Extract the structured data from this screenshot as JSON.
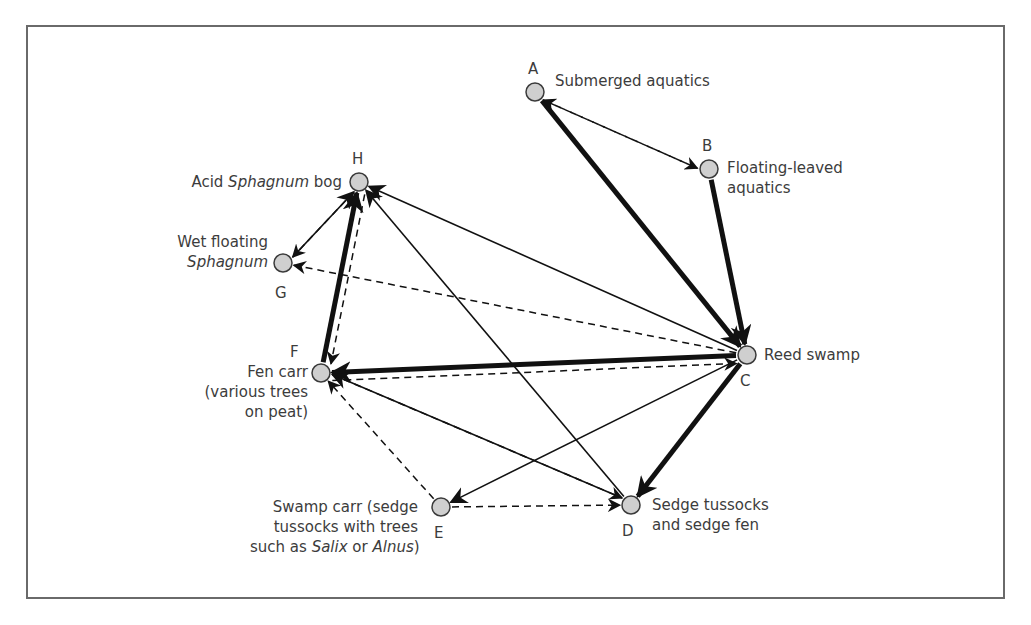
{
  "figure": {
    "colors": {
      "node_fill": "#cfcfcf",
      "node_stroke": "#3a3a3a",
      "edge": "#111111",
      "frame": "#6a6a6a",
      "text": "#3c3c3c"
    }
  },
  "nodes": [
    {
      "id": "A",
      "x": 535,
      "y": 92,
      "letter": "A",
      "label_lines": [
        "Submerged aquatics"
      ]
    },
    {
      "id": "B",
      "x": 709,
      "y": 169,
      "letter": "B",
      "label_lines": [
        "Floating-leaved",
        "aquatics"
      ]
    },
    {
      "id": "C",
      "x": 747,
      "y": 355,
      "letter": "C",
      "label_lines": [
        "Reed swamp"
      ]
    },
    {
      "id": "D",
      "x": 631,
      "y": 505,
      "letter": "D",
      "label_lines": [
        "Sedge tussocks",
        "and sedge fen"
      ]
    },
    {
      "id": "E",
      "x": 441,
      "y": 507,
      "letter": "E",
      "label_lines": [
        "Swamp carr (sedge",
        "tussocks with trees",
        "such as ",
        "Salix",
        " or ",
        "Alnus",
        ")"
      ]
    },
    {
      "id": "F",
      "x": 321,
      "y": 373,
      "letter": "F",
      "label_lines": [
        "Fen carr",
        "(various trees",
        "on peat)"
      ]
    },
    {
      "id": "G",
      "x": 283,
      "y": 263,
      "letter": "G",
      "label_lines": [
        "Wet floating",
        "Sphagnum"
      ]
    },
    {
      "id": "H",
      "x": 359,
      "y": 182,
      "letter": "H",
      "label_lines": [
        "Acid ",
        "Sphagnum",
        " bog"
      ]
    }
  ],
  "labels": {
    "A": "Submerged aquatics",
    "B1": "Floating-leaved",
    "B2": "aquatics",
    "C": "Reed swamp",
    "D1": "Sedge tussocks",
    "D2": "and sedge fen",
    "E1": "Swamp carr (sedge",
    "E2": "tussocks with trees",
    "E3a": "such as ",
    "E3b": "Salix",
    "E3c": " or ",
    "E3d": "Alnus",
    "E3e": ")",
    "F1": "Fen carr",
    "F2": "(various trees",
    "F3": "on peat)",
    "G1": "Wet floating",
    "G2": "Sphagnum",
    "H1": "Acid ",
    "H2": "Sphagnum",
    "H3": " bog"
  },
  "letters": {
    "A": "A",
    "B": "B",
    "C": "C",
    "D": "D",
    "E": "E",
    "F": "F",
    "G": "G",
    "H": "H"
  },
  "edges": [
    {
      "from": "A",
      "to": "C",
      "style": "thick"
    },
    {
      "from": "B",
      "to": "C",
      "style": "thick"
    },
    {
      "from": "C",
      "to": "F",
      "style": "thick"
    },
    {
      "from": "C",
      "to": "D",
      "style": "thick"
    },
    {
      "from": "F",
      "to": "H",
      "style": "thick"
    },
    {
      "from": "A",
      "to": "B",
      "style": "dashed",
      "offset": 4
    },
    {
      "from": "B",
      "to": "A",
      "style": "dashed",
      "offset": 4
    },
    {
      "from": "C",
      "to": "H",
      "style": "thin"
    },
    {
      "from": "C",
      "to": "G",
      "style": "dashed"
    },
    {
      "from": "C",
      "to": "E",
      "style": "thin"
    },
    {
      "from": "F",
      "to": "C",
      "style": "dashed",
      "offset": -8
    },
    {
      "from": "D",
      "to": "H",
      "style": "thin"
    },
    {
      "from": "D",
      "to": "F",
      "style": "thin",
      "offset": 3
    },
    {
      "from": "F",
      "to": "D",
      "style": "dashed",
      "offset": 3
    },
    {
      "from": "E",
      "to": "F",
      "style": "dashed"
    },
    {
      "from": "E",
      "to": "D",
      "style": "dashed"
    },
    {
      "from": "G",
      "to": "H",
      "style": "thin",
      "offset": 3
    },
    {
      "from": "H",
      "to": "G",
      "style": "dashed",
      "offset": 3
    },
    {
      "from": "H",
      "to": "F",
      "style": "dashed",
      "offset": 8
    }
  ]
}
